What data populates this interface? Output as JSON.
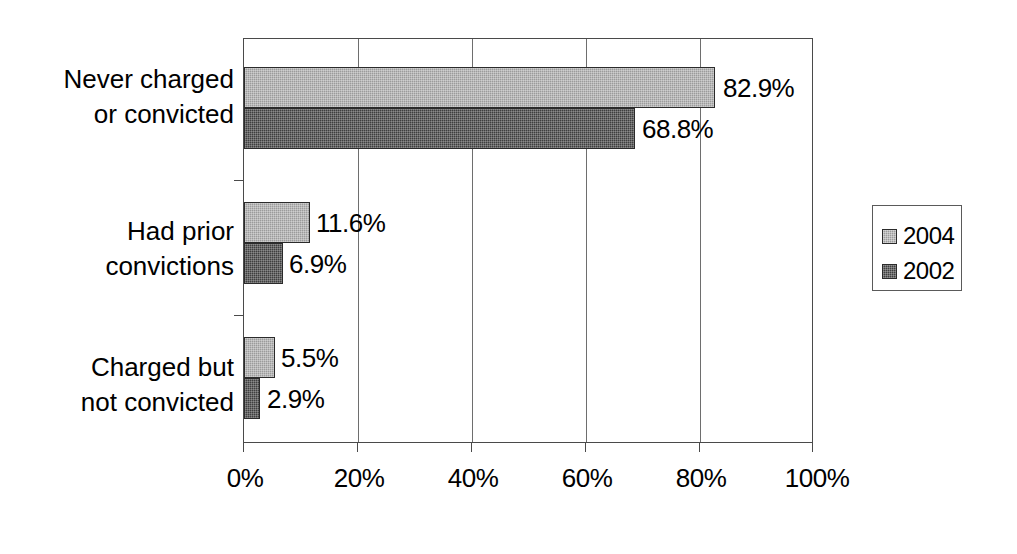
{
  "chart_data": {
    "type": "bar",
    "orientation": "horizontal",
    "title": "",
    "subtitle": "",
    "xlabel": "",
    "ylabel": "",
    "xlim": [
      0,
      100
    ],
    "xticks": [
      "0%",
      "20%",
      "40%",
      "60%",
      "80%",
      "100%"
    ],
    "xtick_values": [
      0,
      20,
      40,
      60,
      80,
      100
    ],
    "grid": "vertical",
    "legend_position": "right",
    "categories": [
      "Never charged or convicted",
      "Had prior convictions",
      "Charged but not convicted"
    ],
    "category_label_lines": [
      [
        "Never charged",
        "or convicted"
      ],
      [
        "Had prior",
        "convictions"
      ],
      [
        "Charged but",
        "not convicted"
      ]
    ],
    "series": [
      {
        "name": "2004",
        "color": "#9b9b9b",
        "values": [
          82.9,
          11.6,
          5.5
        ],
        "labels": [
          "82.9%",
          "11.6%",
          "5.5%"
        ]
      },
      {
        "name": "2002",
        "color": "#3f3f3f",
        "values": [
          68.8,
          6.9,
          2.9
        ],
        "labels": [
          "68.8%",
          "6.9%",
          "2.9%"
        ]
      }
    ]
  },
  "legend": {
    "items": [
      {
        "label": "2004",
        "color": "#9b9b9b"
      },
      {
        "label": "2002",
        "color": "#3f3f3f"
      }
    ]
  },
  "axis": {
    "xticklabels": [
      "0%",
      "20%",
      "40%",
      "60%",
      "80%",
      "100%"
    ]
  },
  "labels": {
    "cat0_line0": "Never charged",
    "cat0_line1": "or convicted",
    "cat1_line0": "Had prior",
    "cat1_line1": "convictions",
    "cat2_line0": "Charged but",
    "cat2_line1": "not convicted",
    "v_2004_0": "82.9%",
    "v_2002_0": "68.8%",
    "v_2004_1": "11.6%",
    "v_2002_1": "6.9%",
    "v_2004_2": "5.5%",
    "v_2002_2": "2.9%"
  }
}
